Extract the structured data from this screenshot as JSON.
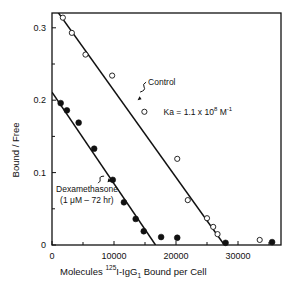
{
  "chart_data": {
    "type": "scatter",
    "title": "",
    "xlabel": "Molecules 125I-IgG1 Bound per Cell",
    "xlabel_parts": {
      "prefix": "Molecules",
      "isotope": "125",
      "main": "I-IgG",
      "sub": "1",
      "suffix": "Bound per Cell"
    },
    "ylabel": "Bound / Free",
    "xlim": [
      0,
      36000
    ],
    "ylim": [
      0,
      0.32
    ],
    "x_ticks": [
      0,
      10000,
      20000,
      30000
    ],
    "x_tick_labels": [
      "0",
      "10000",
      "20000",
      "30000"
    ],
    "x_minor_ticks": [
      5000,
      15000,
      25000,
      35000
    ],
    "y_ticks": [
      0,
      0.1,
      0.2,
      0.3
    ],
    "y_tick_labels": [
      "0",
      "0.1",
      "0.2",
      "0.3"
    ],
    "y_minor_ticks": [
      0.05,
      0.15,
      0.25
    ],
    "grid": false,
    "legend": "none (inline annotations)",
    "annotations": [
      {
        "text": "Control",
        "x": 15500,
        "y": 0.225,
        "arrow_to": [
          13800,
          0.2
        ]
      },
      {
        "text": "Ka = 1.1 x 10",
        "superscript": "8",
        "unit": "M",
        "unit_superscript": "-1",
        "x": 18000,
        "y": 0.18
      },
      {
        "text_line1": "Dexamethasone",
        "text_line2": "(1 μM – 72 hr)",
        "x": 5500,
        "y": 0.073,
        "arrow_to": [
          9600,
          0.088
        ]
      }
    ],
    "series": [
      {
        "name": "Control",
        "marker": "open-circle",
        "points": [
          [
            1750,
            0.314
          ],
          [
            3200,
            0.293
          ],
          [
            5400,
            0.263
          ],
          [
            9700,
            0.234
          ],
          [
            14900,
            0.184
          ],
          [
            20200,
            0.119
          ],
          [
            21900,
            0.062
          ],
          [
            25000,
            0.037
          ],
          [
            26000,
            0.025
          ],
          [
            26700,
            0.015
          ],
          [
            33500,
            0.007
          ]
        ],
        "fit_line": {
          "x0": 0,
          "y0": 0.333,
          "x1": 27800,
          "y1": 0
        }
      },
      {
        "name": "Dexamethasone (1 μM – 72 hr)",
        "marker": "filled-circle",
        "points": [
          [
            1400,
            0.196
          ],
          [
            2400,
            0.186
          ],
          [
            4300,
            0.169
          ],
          [
            6800,
            0.133
          ],
          [
            9800,
            0.09
          ],
          [
            11600,
            0.059
          ],
          [
            13500,
            0.036
          ],
          [
            14800,
            0.019
          ],
          [
            17600,
            0.011
          ],
          [
            20200,
            0.01
          ],
          [
            28000,
            0.003
          ],
          [
            35500,
            0.004
          ]
        ],
        "fit_line": {
          "x0": 0,
          "y0": 0.211,
          "x1": 16700,
          "y1": 0
        }
      }
    ]
  },
  "layout": {
    "plot_left": 52,
    "plot_right": 281,
    "plot_top": 13,
    "plot_bottom": 245,
    "x_px_per_unit": 0.0062,
    "y_zero_px": 245,
    "y_px_per_unit": 724
  }
}
